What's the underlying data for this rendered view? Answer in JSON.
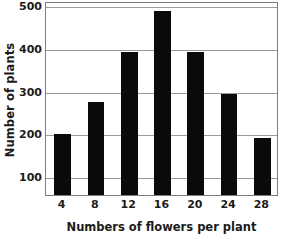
{
  "chart_data": {
    "type": "bar",
    "title": "",
    "xlabel": "Numbers of flowers per plant",
    "ylabel": "Number of plants",
    "categories": [
      "4",
      "8",
      "12",
      "16",
      "20",
      "24",
      "28"
    ],
    "values": [
      198,
      272,
      390,
      487,
      390,
      292,
      188
    ],
    "x_tick_labels": [
      "4",
      "8",
      "12",
      "16",
      "20",
      "24",
      "28"
    ],
    "y_tick_labels": [
      "100",
      "200",
      "300",
      "400",
      "500"
    ],
    "y_ticks": [
      100,
      200,
      300,
      400,
      500
    ],
    "ylim": [
      55,
      510
    ],
    "xlim": [
      2,
      30
    ],
    "grid": "horizontal",
    "legend": "none",
    "bar_color": "#0a0a0a",
    "grid_color": "#9a9a9a",
    "frame_color": "#7d7d7d",
    "background_color": "#ffffff",
    "text_color": "#1b1b1b"
  }
}
